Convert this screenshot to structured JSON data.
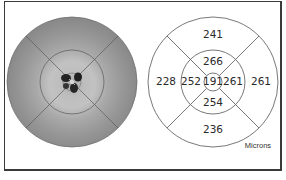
{
  "report": {
    "units_label": "Microns"
  },
  "thickness_map": {
    "description": "grayscale retinal thickness map with ETDRS grid overlay"
  },
  "etdrs_grid": {
    "center": "191",
    "inner_superior": "266",
    "inner_inferior": "254",
    "inner_nasal_left": "252",
    "inner_temporal_right": "261",
    "outer_superior": "241",
    "outer_inferior": "236",
    "outer_left": "228",
    "outer_right": "261"
  },
  "colors": {
    "map_gray": "#8c8c8c",
    "map_light": "#c4c4c4",
    "grid_line": "#555555",
    "frame": "#3a3a3a"
  }
}
